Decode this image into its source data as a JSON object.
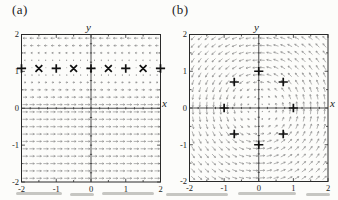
{
  "figure": {
    "panels": [
      {
        "label": "(a)",
        "axis_label_x": "x",
        "axis_label_y": "y"
      },
      {
        "label": "(b)",
        "axis_label_x": "x",
        "axis_label_y": "y"
      }
    ]
  },
  "chart_data": [
    {
      "type": "quiver",
      "title": "",
      "xlabel": "x",
      "ylabel": "y",
      "xlim": [
        -2,
        2
      ],
      "ylim": [
        -2,
        2
      ],
      "x_tick_labels": [
        "-2",
        "-1",
        "0",
        "1",
        "2"
      ],
      "y_tick_labels": [
        "2",
        "1",
        "0",
        "-1",
        "-2"
      ],
      "major_ticks": [
        -2,
        -1,
        0,
        1,
        2
      ],
      "minor_tick_step": 0.5,
      "grid_min": -1.9,
      "grid_max": 1.9,
      "grid_step": 0.2,
      "field_type": "horizontal_shear",
      "zero_at_y": 1.1,
      "field_note": "dx/dt = 1.1 - y, dy/dt = 0; arrows horizontal, vanishing near y = 1.1",
      "markers": [
        {
          "x": -2.0,
          "y": 1.08,
          "glyph": "plus"
        },
        {
          "x": -1.5,
          "y": 1.08,
          "glyph": "cross"
        },
        {
          "x": -1.0,
          "y": 1.08,
          "glyph": "plus"
        },
        {
          "x": -0.5,
          "y": 1.08,
          "glyph": "cross"
        },
        {
          "x": 0.0,
          "y": 1.08,
          "glyph": "plus"
        },
        {
          "x": 0.5,
          "y": 1.08,
          "glyph": "cross"
        },
        {
          "x": 1.0,
          "y": 1.08,
          "glyph": "plus"
        },
        {
          "x": 1.5,
          "y": 1.08,
          "glyph": "cross"
        },
        {
          "x": 2.0,
          "y": 1.08,
          "glyph": "plus"
        }
      ]
    },
    {
      "type": "quiver",
      "title": "",
      "xlabel": "x",
      "ylabel": "y",
      "xlim": [
        -2,
        2
      ],
      "ylim": [
        -2,
        2
      ],
      "x_tick_labels": [
        "-2",
        "-1",
        "0",
        "1",
        "2"
      ],
      "y_tick_labels": [
        "2",
        "1",
        "0",
        "-1",
        "-2"
      ],
      "major_ticks": [
        -2,
        -1,
        0,
        1,
        2
      ],
      "minor_tick_step": 0.5,
      "grid_min": -1.9,
      "grid_max": 1.9,
      "grid_step": 0.2,
      "field_type": "rotation",
      "direction": "counterclockwise",
      "field_note": "dx/dt = -y, dy/dt = x; arrows tangent to circles about origin",
      "markers": [
        {
          "x": 0.0,
          "y": 1.0,
          "glyph": "plus"
        },
        {
          "x": 0.707,
          "y": 0.707,
          "glyph": "plus"
        },
        {
          "x": 1.0,
          "y": 0.0,
          "glyph": "plus"
        },
        {
          "x": 0.707,
          "y": -0.707,
          "glyph": "plus"
        },
        {
          "x": 0.0,
          "y": -1.0,
          "glyph": "plus"
        },
        {
          "x": -0.707,
          "y": -0.707,
          "glyph": "plus"
        },
        {
          "x": -1.0,
          "y": 0.0,
          "glyph": "plus"
        },
        {
          "x": -0.707,
          "y": 0.707,
          "glyph": "plus"
        }
      ]
    }
  ],
  "colors": {
    "ink": "#1b1b1b",
    "frame": "#2a2a2a",
    "axis": "#3a3a3a",
    "arrow": "#8d8d8d",
    "marker": "#111111",
    "paper": "#fcfcfa"
  }
}
